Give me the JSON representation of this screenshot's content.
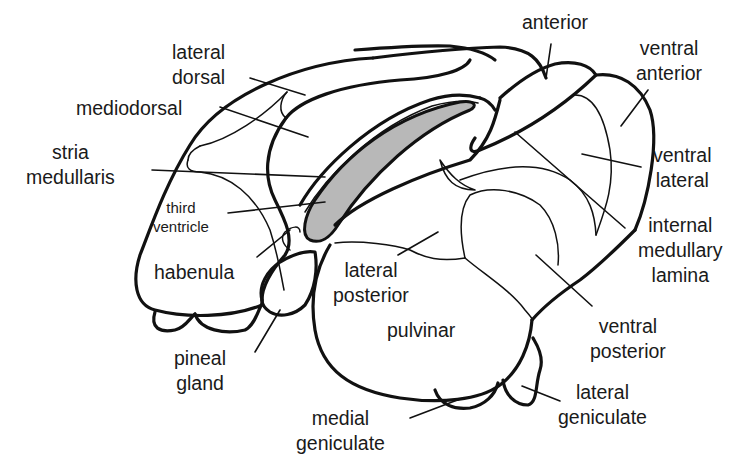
{
  "diagram": {
    "colors": {
      "outline": "#111111",
      "background": "#ffffff",
      "third_ventricle_fill": "#b8b8b8",
      "text": "#1a1a1a"
    },
    "labels": {
      "lateral_dorsal": "lateral\ndorsal",
      "mediodorsal": "mediodorsal",
      "stria_medullaris": "stria\nmedullaris",
      "third_ventricle": "third\nventricle",
      "habenula": "habenula",
      "pineal_gland": "pineal\ngland",
      "anterior": "anterior",
      "ventral_anterior": "ventral\nanterior",
      "ventral_lateral": "ventral\nlateral",
      "internal_medullary_lamina": "internal\nmedullary\nlamina",
      "lateral_posterior": "lateral\nposterior",
      "pulvinar": "pulvinar",
      "ventral_posterior": "ventral\nposterior",
      "lateral_geniculate": "lateral\ngeniculate",
      "medial_geniculate": "medial\ngeniculate"
    }
  }
}
